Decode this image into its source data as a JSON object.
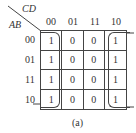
{
  "kmap": {
    "row_var": "AB",
    "col_var": "CD",
    "col_labels": [
      "00",
      "01",
      "11",
      "10"
    ],
    "row_labels": [
      "00",
      "01",
      "11",
      "10"
    ],
    "cells": [
      [
        "1",
        "0",
        "0",
        "1"
      ],
      [
        "1",
        "0",
        "0",
        "1"
      ],
      [
        "1",
        "0",
        "0",
        "1"
      ],
      [
        "1",
        "0",
        "0",
        "1"
      ]
    ],
    "caption": "(a)",
    "groups": [
      {
        "name": "column-00-group",
        "cells": "col 00 all rows"
      },
      {
        "name": "column-10-group",
        "cells": "col 10 all rows"
      }
    ]
  }
}
